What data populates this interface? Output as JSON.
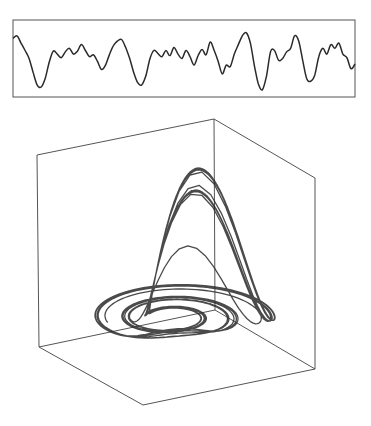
{
  "figure": {
    "background": "#ffffff",
    "ink_color": "#2a2a2a",
    "frame_color": "#555555"
  },
  "chart_data": [
    {
      "type": "line",
      "title": "",
      "xlabel": "",
      "ylabel": "",
      "grid": false,
      "legend": null,
      "frame": {
        "x": 13,
        "y": 20,
        "width": 342,
        "height": 77
      },
      "ylim": [
        -1,
        1
      ],
      "x": [
        0,
        2,
        4,
        6,
        8,
        10,
        12,
        14,
        16,
        18,
        20,
        22,
        24,
        26,
        28,
        30,
        32,
        34,
        36,
        38,
        40,
        42,
        44,
        46,
        48,
        50,
        52,
        54,
        56,
        58,
        60,
        62,
        64,
        66,
        68,
        70,
        72,
        74,
        76,
        78,
        80,
        82,
        84,
        86,
        88,
        90,
        92,
        94,
        96,
        98,
        100,
        102,
        104,
        106,
        108,
        110,
        112,
        114,
        116,
        118,
        120,
        122,
        124,
        126,
        128,
        130,
        132,
        134,
        136,
        138,
        140,
        142,
        144,
        146,
        148,
        150,
        152,
        154,
        156,
        158,
        160,
        162,
        164,
        166,
        168,
        170
      ],
      "values": [
        0.55,
        0.62,
        0.42,
        0.22,
        0.0,
        -0.38,
        -0.72,
        -0.78,
        -0.55,
        -0.1,
        0.2,
        0.12,
        0.02,
        0.18,
        0.28,
        0.12,
        0.2,
        0.38,
        0.22,
        0.05,
        0.1,
        -0.08,
        -0.3,
        -0.18,
        0.12,
        0.36,
        0.48,
        0.52,
        0.3,
        0.0,
        -0.38,
        -0.66,
        -0.72,
        -0.48,
        -0.02,
        0.22,
        0.14,
        0.05,
        0.22,
        0.08,
        0.3,
        0.12,
        0.0,
        0.22,
        0.05,
        -0.18,
        0.08,
        0.25,
        0.1,
        0.45,
        0.22,
        -0.08,
        -0.42,
        -0.18,
        -0.22,
        0.12,
        0.38,
        0.62,
        0.7,
        0.42,
        -0.2,
        -0.7,
        -0.85,
        -0.48,
        0.18,
        0.22,
        -0.05,
        0.0,
        0.18,
        0.28,
        0.62,
        0.48,
        -0.05,
        -0.55,
        -0.62,
        -0.45,
        0.05,
        0.28,
        0.12,
        0.38,
        0.28,
        0.42,
        0.12,
        0.02,
        -0.28,
        -0.15
      ]
    },
    {
      "type": "scatter",
      "subtype": "3d-trajectory",
      "title": "",
      "xlabel": "",
      "ylabel": "",
      "zlabel": "",
      "grid": false,
      "legend": null,
      "box_projected_corners": {
        "front_top_left": [
          37,
          155
        ],
        "back_top": [
          214,
          119
        ],
        "right_top": [
          315,
          178
        ],
        "front_bottom_left": [
          39,
          347
        ],
        "inner_bottom": [
          215,
          310
        ],
        "right_bottom": [
          315,
          369
        ],
        "front_bottom": [
          143,
          405
        ]
      },
      "trajectory_extent": {
        "x_min": 95,
        "x_max": 275,
        "y_min": 168,
        "y_max": 338
      },
      "description": "Chaotic strange attractor rendered as a dense tangle of looping curves inside a perspective wireframe cube"
    }
  ]
}
